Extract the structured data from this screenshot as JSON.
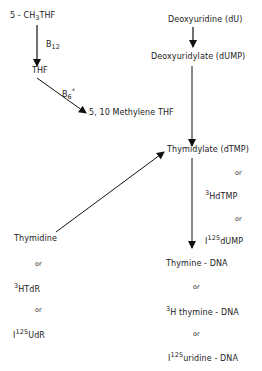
{
  "diagram": {
    "left": {
      "methyl_thf": {
        "prefix": "5 - CH",
        "sub": "3",
        "suffix": "THF"
      },
      "b12": {
        "main": "B",
        "sub": "12"
      },
      "thf": "THF",
      "b6": {
        "main": "B",
        "sub": "6",
        "suffix": "*"
      },
      "methylene_thf": "5, 10 Methylene THF"
    },
    "right": {
      "deoxyuridine": "Deoxyuridine (dU)",
      "deoxyuridylate": "Deoxyuridylate (dUMP)",
      "thymidylate": "Thymidylate (dTMP)",
      "or1": "or",
      "hdtmp": {
        "sup": "3",
        "text": "HdTMP"
      },
      "or2": "or",
      "i125dump": {
        "prefix": "I",
        "sup": "125",
        "text": "dUMP"
      },
      "thymine_dna": "Thymine - DNA",
      "or3": "or",
      "h_thymine_dna": {
        "sup": "3",
        "text": "H thymine - DNA"
      },
      "or4": "or",
      "i125_uridine_dna": {
        "prefix": "I",
        "sup": "125",
        "text": "uridine - DNA"
      }
    },
    "bottom_left": {
      "thymidine": "Thymidine",
      "or1": "or",
      "htdr": {
        "sup": "3",
        "text": "HTdR"
      },
      "or2": "or",
      "i125udr": {
        "prefix": "I",
        "sup": "125",
        "text": "UdR"
      }
    }
  }
}
